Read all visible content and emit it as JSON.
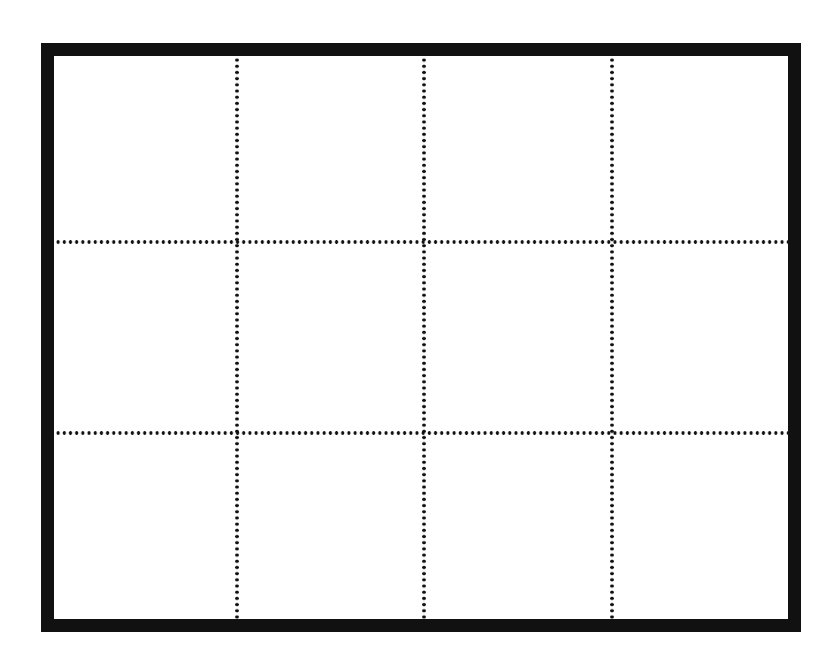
{
  "diagram": {
    "type": "grid",
    "rows": 3,
    "columns": 4,
    "cell_count": 12,
    "outer_border": {
      "style": "solid",
      "color": "#111111",
      "thickness_px": 13
    },
    "divider_lines": {
      "style": "dotted",
      "color": "#111111"
    },
    "vertical_dividers_x": [
      237,
      424,
      612
    ],
    "horizontal_dividers_y": [
      242,
      433
    ],
    "background_color": "#ffffff"
  }
}
